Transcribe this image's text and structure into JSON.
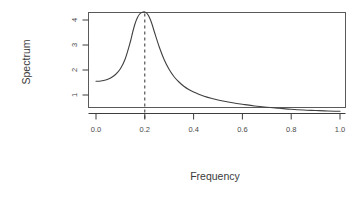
{
  "chart_data": {
    "type": "line",
    "title": "",
    "xlabel": "Frequency",
    "ylabel": "Spectrum",
    "xlim": [
      0.0,
      1.0
    ],
    "ylim": [
      0.25,
      4.4
    ],
    "grid": false,
    "legend": null,
    "x_ticks": [
      "0.0",
      "0.2",
      "0.4",
      "0.6",
      "0.8",
      "1.0"
    ],
    "x_tick_values": [
      0.0,
      0.2,
      0.4,
      0.6,
      0.8,
      1.0
    ],
    "y_ticks": [
      "1",
      "2",
      "3",
      "4"
    ],
    "y_tick_values": [
      1,
      2,
      3,
      4
    ],
    "annotations": [
      {
        "type": "vertical-dashed-line",
        "x": 0.2,
        "label": "peak-frequency"
      }
    ],
    "series": [
      {
        "name": "spectral density",
        "x": [
          0.0,
          0.02,
          0.04,
          0.06,
          0.08,
          0.1,
          0.12,
          0.14,
          0.15,
          0.16,
          0.17,
          0.18,
          0.19,
          0.2,
          0.21,
          0.22,
          0.23,
          0.24,
          0.26,
          0.28,
          0.3,
          0.32,
          0.34,
          0.36,
          0.38,
          0.4,
          0.44,
          0.48,
          0.52,
          0.56,
          0.6,
          0.65,
          0.7,
          0.75,
          0.8,
          0.85,
          0.9,
          0.95,
          1.0
        ],
        "values": [
          1.55,
          1.56,
          1.6,
          1.68,
          1.82,
          2.05,
          2.45,
          3.1,
          3.5,
          3.85,
          4.1,
          4.25,
          4.31,
          4.32,
          4.25,
          4.08,
          3.82,
          3.5,
          2.9,
          2.4,
          2.02,
          1.73,
          1.52,
          1.35,
          1.22,
          1.12,
          0.96,
          0.85,
          0.76,
          0.69,
          0.63,
          0.56,
          0.51,
          0.47,
          0.43,
          0.4,
          0.38,
          0.36,
          0.35
        ]
      }
    ],
    "peak": {
      "x": 0.2,
      "y": 4.32
    }
  },
  "colors": {
    "curve": "#404040",
    "axis": "#3d3d3d",
    "box": "#5a5a5a",
    "text": "#3a3a3a",
    "background": "#ffffff"
  }
}
